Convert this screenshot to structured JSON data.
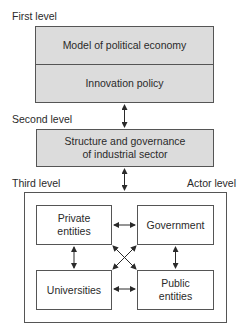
{
  "levels": {
    "first": "First level",
    "second": "Second level",
    "third": "Third level",
    "actor": "Actor level"
  },
  "first_level_box": {
    "top": "Model of political economy",
    "bottom": "Innovation policy"
  },
  "second_level_box": {
    "line1": "Structure and governance",
    "line2": "of industrial sector"
  },
  "actors": {
    "private": {
      "line1": "Private",
      "line2": "entities"
    },
    "government": {
      "line1": "Government"
    },
    "universities": {
      "line1": "Universities"
    },
    "public": {
      "line1": "Public",
      "line2": "entities"
    }
  },
  "colors": {
    "box_fill": "#dcdcdc",
    "border": "#555555"
  }
}
